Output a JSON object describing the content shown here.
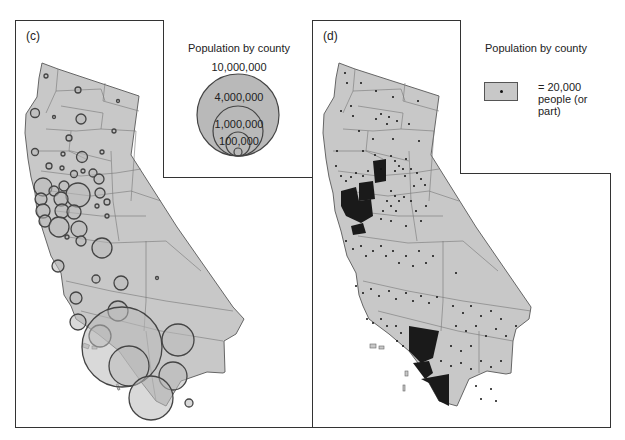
{
  "panels": {
    "c": {
      "label": "(c)",
      "legend": {
        "title": "Population by county",
        "circles": [
          {
            "label": "10,000,000",
            "value": 10000000
          },
          {
            "label": "4,000,000",
            "value": 4000000
          },
          {
            "label": "1,000,000",
            "value": 1000000
          },
          {
            "label": "100,000",
            "value": 100000
          }
        ]
      }
    },
    "d": {
      "label": "(d)",
      "legend": {
        "title": "Population by county",
        "dot_value": "= 20,000",
        "dot_unit": "people (or part)"
      }
    }
  },
  "colors": {
    "land": "#c8c8c8",
    "outline": "#555555",
    "dense_county": "#1a1a1a",
    "dot": "#111111"
  }
}
